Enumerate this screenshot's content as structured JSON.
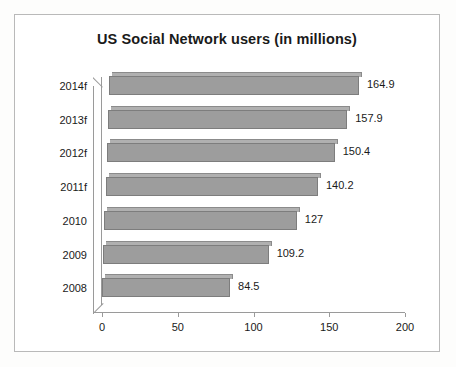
{
  "chart_data": {
    "type": "bar",
    "orientation": "horizontal",
    "title": "US Social Network users (in millions)",
    "xlabel": "",
    "ylabel": "",
    "categories": [
      "2008",
      "2009",
      "2010",
      "2011f",
      "2012f",
      "2013f",
      "2014f"
    ],
    "values": [
      84.5,
      109.2,
      127,
      140.2,
      150.4,
      157.9,
      164.9
    ],
    "data_labels": [
      "84.5",
      "109.2",
      "127",
      "140.2",
      "150.4",
      "157.9",
      "164.9"
    ],
    "xticks": [
      0,
      50,
      100,
      150,
      200
    ],
    "xtick_labels": [
      "0",
      "50",
      "100",
      "150",
      "200"
    ],
    "xlim": [
      0,
      200
    ],
    "grid": false,
    "legend": null,
    "bar_color": "#9d9d9d",
    "bar_top_color": "#b0b0b0",
    "axis_color": "#9a9a9a",
    "text_color": "#1a1a1a",
    "background": "#ffffff"
  }
}
